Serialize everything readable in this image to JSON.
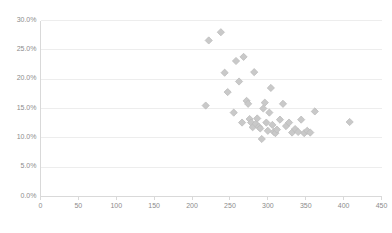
{
  "chart_data": {
    "type": "scatter",
    "title": "",
    "subtitle": "",
    "xlabel": "",
    "ylabel": "",
    "xlim": [
      0,
      450
    ],
    "ylim": [
      0,
      0.3
    ],
    "x_ticks": [
      0,
      50,
      100,
      150,
      200,
      250,
      300,
      350,
      400,
      450
    ],
    "x_tick_labels": [
      "0",
      "50",
      "100",
      "150",
      "200",
      "250",
      "300",
      "350",
      "400",
      "450"
    ],
    "y_ticks": [
      0.0,
      0.05,
      0.1,
      0.15,
      0.2,
      0.25,
      0.3
    ],
    "y_tick_labels": [
      "0.0%",
      "5.0%",
      "10.0%",
      "15.0%",
      "20.0%",
      "25.0%",
      "30.0%"
    ],
    "grid": "horizontal",
    "legend": "none",
    "marker": "diamond",
    "marker_color": "#c9c9c9",
    "marker_edge_color": "#bdbdbd",
    "marker_size": 6,
    "axis_color": "#d9d9d9",
    "grid_color": "#ededed",
    "tick_label_color": "#8c8c8c",
    "background": "#ffffff",
    "series": [
      {
        "name": "Series1",
        "points": [
          [
            218,
            0.155
          ],
          [
            222,
            0.266
          ],
          [
            238,
            0.28
          ],
          [
            243,
            0.211
          ],
          [
            247,
            0.178
          ],
          [
            255,
            0.143
          ],
          [
            258,
            0.231
          ],
          [
            262,
            0.196
          ],
          [
            266,
            0.126
          ],
          [
            268,
            0.238
          ],
          [
            272,
            0.163
          ],
          [
            274,
            0.158
          ],
          [
            276,
            0.132
          ],
          [
            278,
            0.126
          ],
          [
            280,
            0.118
          ],
          [
            282,
            0.212
          ],
          [
            284,
            0.124
          ],
          [
            286,
            0.133
          ],
          [
            288,
            0.119
          ],
          [
            290,
            0.116
          ],
          [
            292,
            0.098
          ],
          [
            294,
            0.15
          ],
          [
            296,
            0.16
          ],
          [
            298,
            0.126
          ],
          [
            300,
            0.112
          ],
          [
            302,
            0.143
          ],
          [
            304,
            0.185
          ],
          [
            306,
            0.122
          ],
          [
            308,
            0.11
          ],
          [
            310,
            0.108
          ],
          [
            312,
            0.114
          ],
          [
            316,
            0.131
          ],
          [
            320,
            0.158
          ],
          [
            324,
            0.12
          ],
          [
            328,
            0.126
          ],
          [
            332,
            0.109
          ],
          [
            336,
            0.115
          ],
          [
            340,
            0.11
          ],
          [
            344,
            0.131
          ],
          [
            348,
            0.108
          ],
          [
            352,
            0.112
          ],
          [
            356,
            0.109
          ],
          [
            362,
            0.145
          ],
          [
            408,
            0.127
          ]
        ]
      }
    ]
  },
  "axes": {
    "y_axis_name": "value-axis",
    "x_axis_name": "category-axis"
  }
}
